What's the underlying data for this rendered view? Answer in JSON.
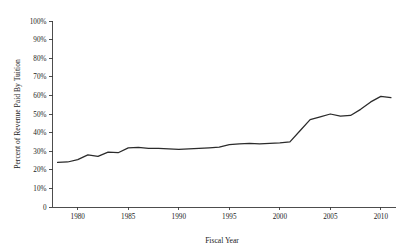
{
  "chart_data": {
    "type": "line",
    "title": "",
    "subtitle": "",
    "xlabel": "Fiscal Year",
    "ylabel": "Percent of Revenue Paid By Tuition",
    "xlim": [
      1977.5,
      2011.5
    ],
    "ylim": [
      0,
      100
    ],
    "grid": false,
    "legend": null,
    "legend_position": "none",
    "x_tick_labels": [
      "1980",
      "1985",
      "1990",
      "1995",
      "2000",
      "2005",
      "2010"
    ],
    "x_ticks": [
      1980,
      1985,
      1990,
      1995,
      2000,
      2005,
      2010
    ],
    "y_tick_labels": [
      "0",
      "10%",
      "20%",
      "30%",
      "40%",
      "50%",
      "60%",
      "70%",
      "80%",
      "90%",
      "100%"
    ],
    "y_ticks": [
      0,
      10,
      20,
      30,
      40,
      50,
      60,
      70,
      80,
      90,
      100
    ],
    "series": [
      {
        "name": "Percent of Revenue Paid By Tuition",
        "color": "#2b2b2b",
        "x": [
          1978,
          1979,
          1980,
          1981,
          1982,
          1983,
          1984,
          1985,
          1986,
          1987,
          1988,
          1989,
          1990,
          1991,
          1992,
          1993,
          1994,
          1995,
          1996,
          1997,
          1998,
          1999,
          2000,
          2001,
          2002,
          2003,
          2004,
          2005,
          2006,
          2007,
          2008,
          2009,
          2010,
          2011
        ],
        "values": [
          24.0,
          24.2,
          25.5,
          28.0,
          27.2,
          29.5,
          29.2,
          31.8,
          32.0,
          31.5,
          31.5,
          31.2,
          31.0,
          31.2,
          31.5,
          31.8,
          32.2,
          33.5,
          34.0,
          34.2,
          34.0,
          34.2,
          34.5,
          35.0,
          41.0,
          47.0,
          48.5,
          50.0,
          48.8,
          49.2,
          52.5,
          56.5,
          59.5,
          58.8
        ]
      }
    ]
  },
  "axes": {
    "x_axis_name": "fiscal-year-axis",
    "y_axis_name": "percent-revenue-axis"
  }
}
